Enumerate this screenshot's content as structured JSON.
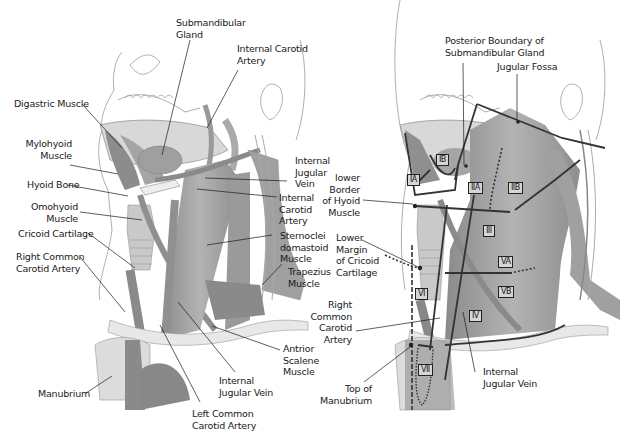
{
  "left_panel": {
    "labels": {
      "submandibular_gland": "Submandibular\nGland",
      "internal_carotid_artery_top": "Internal Carotid\nArtery",
      "digastric_muscle": "Digastric Muscle",
      "mylohyoid_muscle": "Mylohyoid\nMuscle",
      "hyoid_bone": "Hyoid Bone",
      "omohyoid_muscle": "Omohyoid\nMuscle",
      "cricoid_cartilage": "Cricoid Cartilage",
      "right_common_carotid": "Right Common\nCarotid Artery",
      "internal_jugular_vein_upper": "Internal\nJugular\nVein",
      "internal_carotid_artery_mid": "Internal\nCarotid\nArtery",
      "sternocleidomastoid": "Sternoclei\ndomastoid\nMuscle",
      "trapezius": "Trapezius\nMuscle",
      "anterior_scalene": "Antrior\nScalene\nMuscle",
      "internal_jugular_vein_lower": "Internal\nJugular Vein",
      "left_common_carotid": "Left Common\nCarotid Artery",
      "manubrium": "Manubrium"
    }
  },
  "right_panel": {
    "labels": {
      "posterior_boundary": "Posterior Boundary of\nSubmandibular Gland",
      "jugular_fossa": "Jugular Fossa",
      "lower_border_hyoid": "lower\nBorder\nof Hyoid\nMuscle",
      "lower_margin_cricoid": "Lower\nMargin\nof Cricoid\nCartilage",
      "right_common_carotid": "Right\nCommon\nCarotid\nArtery",
      "top_of_manubrium": "Top of\nManubrium",
      "internal_jugular_vein": "Internal\nJugular Vein"
    },
    "levels": {
      "IA": "IA",
      "IB": "IB",
      "IIA": "IIA",
      "IIB": "IIB",
      "III": "III",
      "IV": "IV",
      "VA": "VA",
      "VB": "VB",
      "VI": "VI",
      "VII": "VII"
    }
  }
}
